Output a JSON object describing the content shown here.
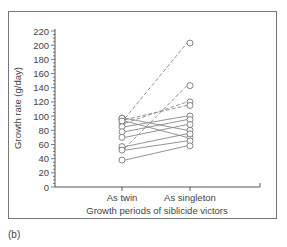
{
  "panel_label": "(b)",
  "chart_data": {
    "type": "line",
    "title": "",
    "xlabel": "Growth periods of siblicide victors",
    "ylabel": "Growth rate (g/day)",
    "categories": [
      "As twin",
      "As singleton"
    ],
    "ylim": [
      0,
      220
    ],
    "yticks": [
      0,
      20,
      40,
      60,
      80,
      100,
      120,
      140,
      160,
      180,
      200,
      220
    ],
    "grid": false,
    "legend": null,
    "series": [
      {
        "name": "victor-1",
        "values": [
          97,
          203
        ],
        "style": "dashed"
      },
      {
        "name": "victor-2",
        "values": [
          55,
          143
        ],
        "style": "dashed"
      },
      {
        "name": "victor-3",
        "values": [
          90,
          120
        ],
        "style": "dashed"
      },
      {
        "name": "victor-4",
        "values": [
          95,
          115
        ],
        "style": "dashed"
      },
      {
        "name": "victor-5",
        "values": [
          97,
          80
        ],
        "style": "solid"
      },
      {
        "name": "victor-6",
        "values": [
          93,
          70
        ],
        "style": "solid"
      },
      {
        "name": "victor-7",
        "values": [
          85,
          100
        ],
        "style": "solid"
      },
      {
        "name": "victor-8",
        "values": [
          78,
          95
        ],
        "style": "solid"
      },
      {
        "name": "victor-9",
        "values": [
          70,
          88
        ],
        "style": "solid"
      },
      {
        "name": "victor-10",
        "values": [
          57,
          75
        ],
        "style": "solid"
      },
      {
        "name": "victor-11",
        "values": [
          52,
          65
        ],
        "style": "solid"
      },
      {
        "name": "victor-12",
        "values": [
          38,
          58
        ],
        "style": "solid"
      }
    ]
  },
  "colors": {
    "axis": "#555555",
    "line": "#888888",
    "marker_fill": "#ffffff",
    "marker_stroke": "#777777",
    "text": "#444444"
  }
}
